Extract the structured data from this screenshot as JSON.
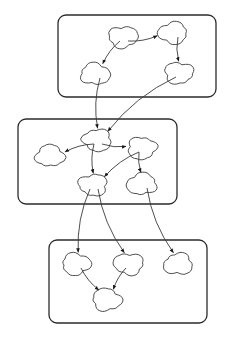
{
  "diagram": {
    "type": "cloud-node-graph",
    "colors": {
      "background": "#ffffff",
      "stroke": "#3a3a3a",
      "box_stroke": "#2b2b2b",
      "arrow": "#1a1a1a"
    },
    "groups": [
      {
        "id": "group-top",
        "nodes": [
          "A",
          "B",
          "C",
          "D"
        ]
      },
      {
        "id": "group-middle",
        "nodes": [
          "E",
          "F",
          "G",
          "H",
          "I"
        ]
      },
      {
        "id": "group-bottom",
        "nodes": [
          "J",
          "K",
          "L",
          "M"
        ]
      }
    ],
    "nodes": [
      {
        "id": "A",
        "group": "group-top",
        "label": ""
      },
      {
        "id": "B",
        "group": "group-top",
        "label": ""
      },
      {
        "id": "C",
        "group": "group-top",
        "label": ""
      },
      {
        "id": "D",
        "group": "group-top",
        "label": ""
      },
      {
        "id": "E",
        "group": "group-middle",
        "label": ""
      },
      {
        "id": "F",
        "group": "group-middle",
        "label": ""
      },
      {
        "id": "G",
        "group": "group-middle",
        "label": ""
      },
      {
        "id": "H",
        "group": "group-middle",
        "label": ""
      },
      {
        "id": "I",
        "group": "group-middle",
        "label": ""
      },
      {
        "id": "J",
        "group": "group-bottom",
        "label": ""
      },
      {
        "id": "K",
        "group": "group-bottom",
        "label": ""
      },
      {
        "id": "L",
        "group": "group-bottom",
        "label": ""
      },
      {
        "id": "M",
        "group": "group-bottom",
        "label": ""
      }
    ],
    "edges": [
      {
        "from": "A",
        "to": "B"
      },
      {
        "from": "A",
        "to": "C"
      },
      {
        "from": "B",
        "to": "D"
      },
      {
        "from": "C",
        "to": "E"
      },
      {
        "from": "D",
        "to": "E"
      },
      {
        "from": "E",
        "to": "F"
      },
      {
        "from": "E",
        "to": "G"
      },
      {
        "from": "E",
        "to": "H"
      },
      {
        "from": "G",
        "to": "H"
      },
      {
        "from": "G",
        "to": "I"
      },
      {
        "from": "H",
        "to": "J"
      },
      {
        "from": "H",
        "to": "K"
      },
      {
        "from": "I",
        "to": "L"
      },
      {
        "from": "J",
        "to": "M"
      },
      {
        "from": "K",
        "to": "M"
      }
    ]
  }
}
